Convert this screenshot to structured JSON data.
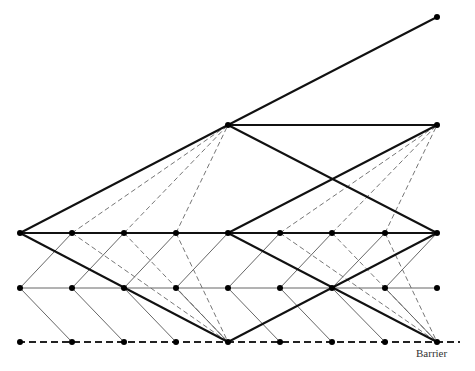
{
  "diagram": {
    "type": "lattice-tree",
    "labels": {
      "barrier": "Barrier"
    },
    "colors": {
      "thick": "#111111",
      "thin": "#555555",
      "dashed": "#666666",
      "node": "#000000",
      "barrier": "#222222"
    },
    "columns_x": [
      20,
      72,
      124,
      176,
      228,
      280,
      332,
      385,
      437
    ],
    "rows_y": [
      17,
      125,
      233,
      288,
      342
    ],
    "nodes": [
      [
        437,
        17
      ],
      [
        228,
        125
      ],
      [
        437,
        125
      ],
      [
        20,
        233
      ],
      [
        72,
        233
      ],
      [
        124,
        233
      ],
      [
        176,
        233
      ],
      [
        228,
        233
      ],
      [
        280,
        233
      ],
      [
        332,
        233
      ],
      [
        385,
        233
      ],
      [
        437,
        233
      ],
      [
        20,
        288
      ],
      [
        72,
        288
      ],
      [
        124,
        288
      ],
      [
        176,
        288
      ],
      [
        228,
        288
      ],
      [
        280,
        288
      ],
      [
        332,
        288
      ],
      [
        385,
        288
      ],
      [
        437,
        288
      ],
      [
        20,
        342
      ],
      [
        72,
        342
      ],
      [
        124,
        342
      ],
      [
        176,
        342
      ],
      [
        228,
        342
      ],
      [
        280,
        342
      ],
      [
        332,
        342
      ],
      [
        385,
        342
      ],
      [
        437,
        342
      ]
    ],
    "thick_edges": [
      [
        20,
        233,
        228,
        125
      ],
      [
        228,
        125,
        437,
        17
      ],
      [
        228,
        125,
        437,
        125
      ],
      [
        228,
        125,
        437,
        233
      ],
      [
        20,
        233,
        437,
        233
      ],
      [
        20,
        233,
        228,
        342
      ],
      [
        228,
        342,
        437,
        233
      ],
      [
        228,
        233,
        437,
        342
      ],
      [
        228,
        233,
        437,
        125
      ]
    ],
    "thin_edges": [
      [
        20,
        288,
        437,
        288
      ],
      [
        20,
        288,
        72,
        233
      ],
      [
        72,
        288,
        124,
        233
      ],
      [
        124,
        288,
        176,
        233
      ],
      [
        176,
        288,
        228,
        233
      ],
      [
        228,
        288,
        280,
        233
      ],
      [
        280,
        288,
        332,
        233
      ],
      [
        332,
        288,
        385,
        233
      ],
      [
        385,
        288,
        437,
        233
      ],
      [
        20,
        288,
        72,
        342
      ],
      [
        72,
        288,
        124,
        342
      ],
      [
        124,
        288,
        176,
        342
      ],
      [
        176,
        288,
        228,
        342
      ],
      [
        228,
        288,
        280,
        342
      ],
      [
        280,
        288,
        332,
        342
      ],
      [
        332,
        288,
        385,
        342
      ],
      [
        385,
        288,
        437,
        342
      ]
    ],
    "dashed_edges": [
      [
        72,
        233,
        228,
        125
      ],
      [
        124,
        233,
        228,
        125
      ],
      [
        176,
        233,
        228,
        125
      ],
      [
        280,
        233,
        437,
        125
      ],
      [
        332,
        233,
        437,
        125
      ],
      [
        385,
        233,
        437,
        125
      ],
      [
        72,
        233,
        228,
        342
      ],
      [
        124,
        233,
        228,
        342
      ],
      [
        176,
        233,
        228,
        342
      ],
      [
        280,
        233,
        437,
        342
      ],
      [
        332,
        233,
        437,
        342
      ],
      [
        385,
        233,
        437,
        342
      ]
    ],
    "barrier_line": [
      18,
      342,
      460,
      342
    ]
  }
}
